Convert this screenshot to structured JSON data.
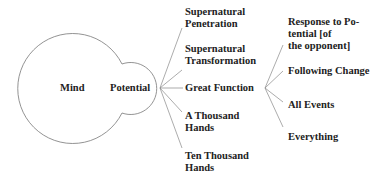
{
  "diagram": {
    "center": {
      "mind": "Mind",
      "potential": "Potential"
    },
    "branches": [
      {
        "label": "Supernatural\nPenetration"
      },
      {
        "label": "Supernatural\nTransformation"
      },
      {
        "label": "Great Function"
      },
      {
        "label": "A Thousand\nHands"
      },
      {
        "label": "Ten Thousand\nHands"
      }
    ],
    "sub_branches": [
      {
        "label": "Response to Po-\ntential [of\nthe opponent]"
      },
      {
        "label": "Following Change"
      },
      {
        "label": "All Events"
      },
      {
        "label": "Everything"
      }
    ],
    "colors": {
      "line": "#888888",
      "text": "#222222"
    }
  }
}
